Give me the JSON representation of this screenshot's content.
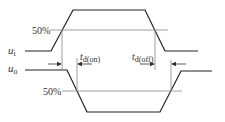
{
  "diagram": {
    "type": "timing-diagram",
    "colors": {
      "wave": "#222222",
      "ref": "#888888",
      "text": "#333333",
      "background": "#ffffff"
    },
    "signals": {
      "input": {
        "label": "u",
        "sub": "i"
      },
      "output": {
        "label": "u",
        "sub": "o"
      }
    },
    "threshold_labels": {
      "input": "50%",
      "output": "50%"
    },
    "delays": {
      "on": {
        "label": "t",
        "sub": "d(on)"
      },
      "off": {
        "label": "t",
        "sub": "d(off)"
      }
    }
  }
}
